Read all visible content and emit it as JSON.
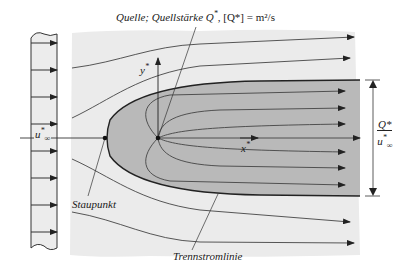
{
  "figure": {
    "type": "flow-around-semi-infinite-body (Rankine half-body)",
    "colors": {
      "background": "#ffffff",
      "flow_field": "#ebebeb",
      "half_body": "#b9b9b9",
      "lines": "#333333"
    }
  },
  "labels": {
    "source": {
      "text_prefix": "Quelle; Quellstärke ",
      "symbol": "Q",
      "sup": "*",
      "unit_text": ", [Q*] = m²/s"
    },
    "stagnation_point": "Staupunkt",
    "dividing_streamline": "Trennstromlinie",
    "x_axis": {
      "symbol": "x",
      "sup": "*"
    },
    "y_axis": {
      "symbol": "y",
      "sup": "*"
    },
    "freestream": {
      "symbol": "u",
      "sup": "*",
      "sub": "∞"
    },
    "width_dimension": {
      "numerator": "Q*",
      "denominator_symbol": "u",
      "denominator_sup": "*",
      "denominator_sub": "∞"
    }
  },
  "elements": {
    "inflow_profile_arrows": 8,
    "outer_streamlines_above": 2,
    "outer_streamlines_below": 2,
    "inner_streamlines": 6,
    "points": [
      "stagnation-point",
      "source-point"
    ]
  }
}
